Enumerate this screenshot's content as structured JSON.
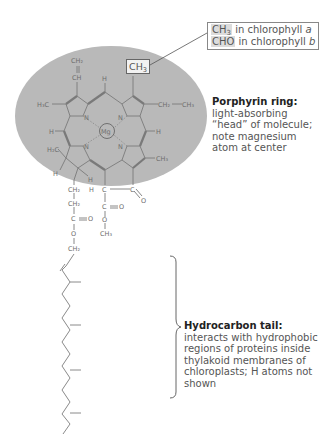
{
  "figure": {
    "colors": {
      "ring_shade": "#b9b9b9",
      "text": "#555555",
      "bonds": "#7a7a7a"
    }
  },
  "callout": {
    "rows": [
      {
        "group": "CH",
        "group_sub": "3",
        "text": " in chlorophyll ",
        "variant": "a"
      },
      {
        "group": "CHO",
        "group_sub": "",
        "text": " in chlorophyll ",
        "variant": "b"
      }
    ],
    "target_group": "CH",
    "target_sub": "3"
  },
  "porphyrin": {
    "title": "Porphyrin ring:",
    "body": "light-absorbing\n“head” of molecule;\nnote magnesium\natom at center"
  },
  "tail": {
    "title": "Hydrocarbon tail:",
    "body": "interacts with hydrophobic\nregions of proteins inside\nthylakoid membranes of\nchloroplasts; H atoms not\nshown"
  },
  "atoms": {
    "mg": "Mg",
    "n": "N",
    "c": "C",
    "h": "H",
    "o": "O",
    "ch2": "CH₂",
    "ch3": "CH₃",
    "ch": "CH",
    "h3c": "H₃C",
    "h2c": "H₂C"
  }
}
